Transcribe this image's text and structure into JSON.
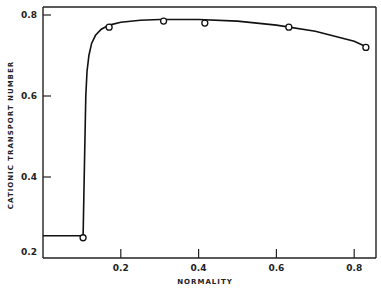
{
  "chart_data": {
    "type": "line",
    "title": "",
    "xlabel": "NORMALITY",
    "ylabel": "CATIONIC   TRANSPORT   NUMBER",
    "xlim": [
      0,
      0.855
    ],
    "ylim": [
      0.2,
      0.82
    ],
    "x_ticks": [
      0.2,
      0.4,
      0.6,
      0.8
    ],
    "x_tick_labels": [
      "0.2",
      "0.4",
      "0.6",
      "0.8"
    ],
    "y_ticks": [
      0.2,
      0.4,
      0.6,
      0.8
    ],
    "y_tick_labels": [
      "0.2",
      "0.4",
      "0.6",
      "0.8"
    ],
    "grid": false,
    "legend": null,
    "series": [
      {
        "name": "measured",
        "style": "open-circle-markers",
        "x": [
          0.103,
          0.17,
          0.31,
          0.416,
          0.632,
          0.83
        ],
        "y": [
          0.25,
          0.77,
          0.785,
          0.78,
          0.77,
          0.72
        ]
      },
      {
        "name": "fitted-curve",
        "style": "solid-line",
        "x": [
          0.0,
          0.103,
          0.107,
          0.11,
          0.113,
          0.118,
          0.125,
          0.135,
          0.15,
          0.17,
          0.2,
          0.25,
          0.3,
          0.4,
          0.5,
          0.6,
          0.7,
          0.8,
          0.835
        ],
        "y": [
          0.255,
          0.255,
          0.45,
          0.6,
          0.66,
          0.7,
          0.73,
          0.75,
          0.765,
          0.775,
          0.782,
          0.787,
          0.789,
          0.789,
          0.785,
          0.775,
          0.76,
          0.735,
          0.72
        ]
      }
    ]
  }
}
